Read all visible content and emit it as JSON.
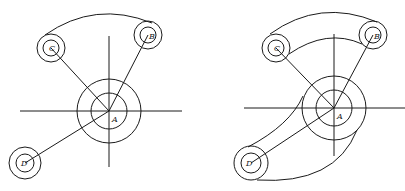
{
  "figures": [
    {
      "id": "left",
      "description": "Layout of pivot A with three arm ends B, C, D; arc links C to B",
      "labels": {
        "A": "A",
        "B": "B",
        "C": "C",
        "D": "D"
      }
    },
    {
      "id": "right",
      "description": "Completed outline: tangent arcs connect circle C to B and circle D to A",
      "labels": {
        "A": "A",
        "B": "B",
        "C": "C",
        "D": "D"
      }
    }
  ],
  "colors": {
    "stroke": "#1a1a1a",
    "background": "#ffffff"
  }
}
